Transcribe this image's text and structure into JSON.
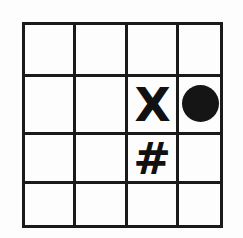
{
  "figure": {
    "background_color": "#fdfdfd",
    "line_color": "#1a1a1a",
    "symbol_color": "#111111"
  },
  "grid": {
    "rows": 4,
    "columns": 4,
    "row_labels": [
      "1",
      "2",
      "3",
      "4"
    ],
    "column_labels": [
      "1",
      "2",
      "3",
      "4"
    ],
    "line_thickness_px": 3,
    "vertical_line_x": [
      23,
      75,
      126,
      177,
      223
    ],
    "horizontal_line_y": [
      23,
      75,
      133,
      182,
      228
    ]
  },
  "symbols": [
    {
      "id": "x-mark",
      "glyph": "X",
      "icon": "x-letter-icon",
      "row": 2,
      "column": 3
    },
    {
      "id": "dot-mark",
      "glyph": "",
      "icon": "filled-circle-icon",
      "row": 2,
      "column": 4
    },
    {
      "id": "hash-mark",
      "glyph": "#",
      "icon": "hash-symbol-icon",
      "row": 3,
      "column": 3
    }
  ],
  "empty_cells_note": "all other cells are blank"
}
